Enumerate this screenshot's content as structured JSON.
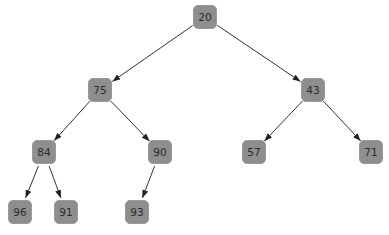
{
  "tree": {
    "type": "binary-heap-tree",
    "node_color": "#8e8e8e",
    "edge_color": "#333333",
    "nodes": [
      {
        "id": "n0",
        "value": "20",
        "x": 205,
        "y": 17
      },
      {
        "id": "n1",
        "value": "75",
        "x": 100,
        "y": 90
      },
      {
        "id": "n2",
        "value": "43",
        "x": 313,
        "y": 90
      },
      {
        "id": "n3",
        "value": "84",
        "x": 44,
        "y": 152
      },
      {
        "id": "n4",
        "value": "90",
        "x": 160,
        "y": 152
      },
      {
        "id": "n5",
        "value": "57",
        "x": 254,
        "y": 152
      },
      {
        "id": "n6",
        "value": "71",
        "x": 371,
        "y": 152
      },
      {
        "id": "n7",
        "value": "96",
        "x": 20,
        "y": 212
      },
      {
        "id": "n8",
        "value": "91",
        "x": 66,
        "y": 212
      },
      {
        "id": "n9",
        "value": "93",
        "x": 137,
        "y": 212
      }
    ],
    "edges": [
      {
        "from": "n0",
        "to": "n1"
      },
      {
        "from": "n0",
        "to": "n2"
      },
      {
        "from": "n1",
        "to": "n3"
      },
      {
        "from": "n1",
        "to": "n4"
      },
      {
        "from": "n2",
        "to": "n5"
      },
      {
        "from": "n2",
        "to": "n6"
      },
      {
        "from": "n3",
        "to": "n7"
      },
      {
        "from": "n3",
        "to": "n8"
      },
      {
        "from": "n4",
        "to": "n9"
      }
    ]
  }
}
